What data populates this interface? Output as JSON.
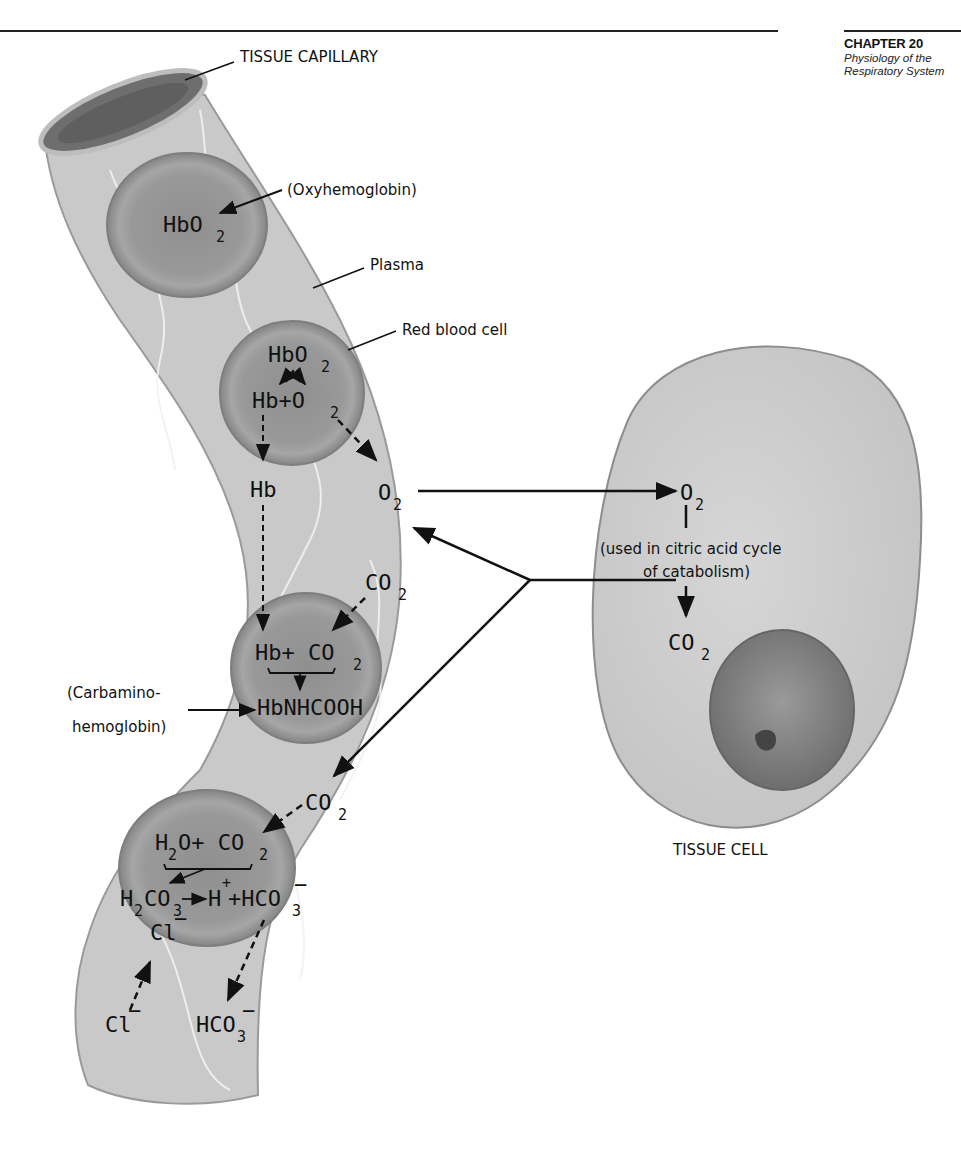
{
  "header": {
    "chapter": "CHAPTER 20",
    "subtitle_line1": "Physiology of the",
    "subtitle_line2": "Respiratory System"
  },
  "labels": {
    "tissue_capillary": "TISSUE CAPILLARY",
    "oxyhemoglobin": "(Oxyhemoglobin)",
    "plasma": "Plasma",
    "red_blood_cell": "Red blood cell",
    "carbamino_line1": "(Carbamino-",
    "carbamino_line2": "hemoglobin)",
    "citric_line1": "(used in citric acid cycle",
    "citric_line2": "of catabolism)",
    "tissue_cell": "TISSUE CELL"
  },
  "formulas": {
    "rbc1_hbo2": "HbO",
    "rbc2_hbo2": "HbO",
    "rbc2_hb_o2": "Hb+O",
    "plasma_o2": "O",
    "hb": "Hb",
    "plasma_co2_upper": "CO",
    "rbc3_hb_co2": "Hb+ CO",
    "rbc3_product": "HbNHCOOH",
    "plasma_co2_lower": "CO",
    "rbc4_h2o_co2_a": "H",
    "rbc4_h2o_co2_b": "O+ CO",
    "rbc4_h2co3_a": "H",
    "rbc4_h2co3_b": "CO",
    "rbc4_h": "H",
    "rbc4_hco3": "+HCO",
    "rbc4_cl": "Cl",
    "plasma_cl": "Cl",
    "plasma_hco3": "HCO",
    "cell_o2": "O",
    "cell_co2": "CO",
    "subscript_2": "2",
    "subscript_3": "3",
    "minus": "−",
    "plus": "+"
  },
  "colors": {
    "plasma": "#c8c8c8",
    "rbc_outer": "#8a8a8a",
    "rbc_inner": "#9a9a9a",
    "cell": "#cfcfcf",
    "nucleus": "#8c8c8c",
    "ink": "#111111"
  }
}
